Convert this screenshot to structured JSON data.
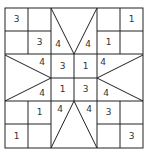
{
  "puzzle": {
    "type": "star-grid number puzzle",
    "grid_size": 6,
    "line_color": "#222222",
    "numbers": [
      {
        "id": "n0",
        "value": "3",
        "cx": 16.5,
        "cy": 19.5
      },
      {
        "id": "n1",
        "value": "1",
        "cx": 131.5,
        "cy": 19.5
      },
      {
        "id": "n2",
        "value": "3",
        "cx": 39.5,
        "cy": 42.5
      },
      {
        "id": "n3",
        "value": "4",
        "cx": 58,
        "cy": 44
      },
      {
        "id": "n4",
        "value": "4",
        "cx": 88,
        "cy": 44
      },
      {
        "id": "n5",
        "value": "1",
        "cx": 108.5,
        "cy": 42.5
      },
      {
        "id": "n6",
        "value": "4",
        "cx": 42,
        "cy": 62
      },
      {
        "id": "n7",
        "value": "3",
        "cx": 62.5,
        "cy": 66
      },
      {
        "id": "n8",
        "value": "1",
        "cx": 85.5,
        "cy": 66
      },
      {
        "id": "n9",
        "value": "4",
        "cx": 103,
        "cy": 62
      },
      {
        "id": "n10",
        "value": "4",
        "cx": 42,
        "cy": 93
      },
      {
        "id": "n11",
        "value": "1",
        "cx": 62.5,
        "cy": 89
      },
      {
        "id": "n12",
        "value": "3",
        "cx": 85.5,
        "cy": 89
      },
      {
        "id": "n13",
        "value": "4",
        "cx": 106,
        "cy": 93
      },
      {
        "id": "n14",
        "value": "1",
        "cx": 39.5,
        "cy": 112.5
      },
      {
        "id": "n15",
        "value": "4",
        "cx": 60,
        "cy": 109
      },
      {
        "id": "n16",
        "value": "4",
        "cx": 89,
        "cy": 109
      },
      {
        "id": "n17",
        "value": "3",
        "cx": 108.5,
        "cy": 112.5
      },
      {
        "id": "n18",
        "value": "1",
        "cx": 16.5,
        "cy": 136
      },
      {
        "id": "n19",
        "value": "3",
        "cx": 131.5,
        "cy": 136
      }
    ]
  }
}
